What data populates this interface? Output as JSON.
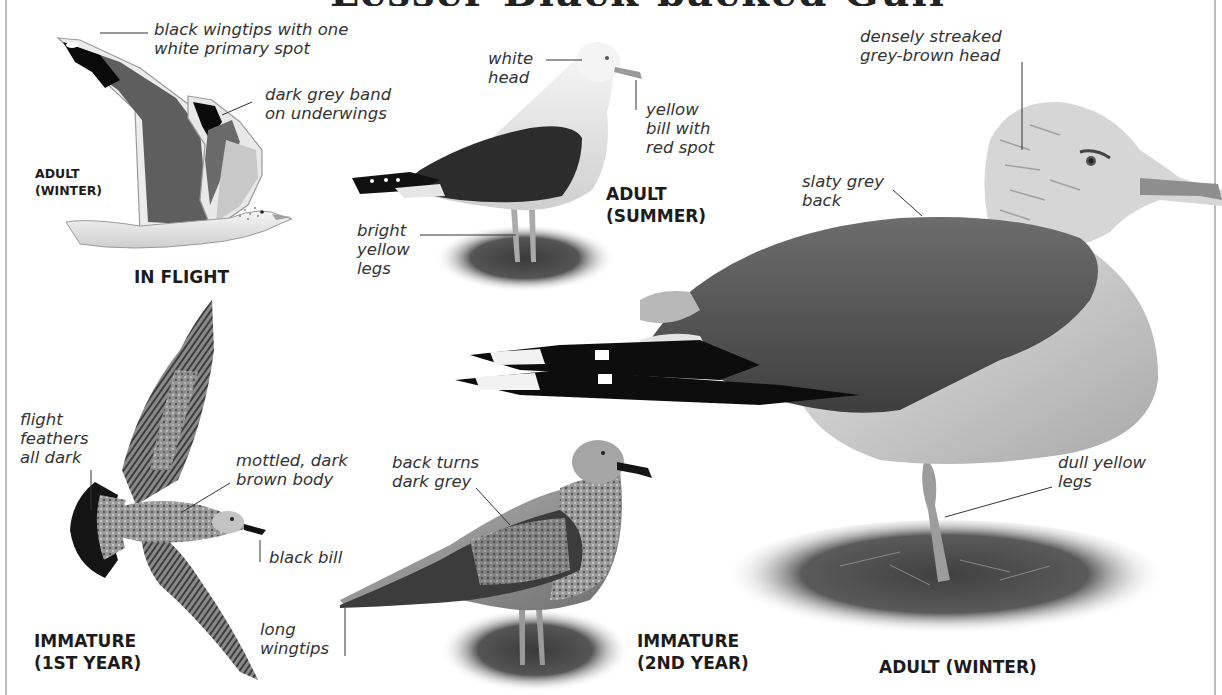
{
  "page": {
    "title_partial": "Lesser Black-backed Gull",
    "accent_colors": {
      "ink": "#1c1c1c",
      "annotation": "#333333",
      "border": "#bdbdbd"
    }
  },
  "figures": {
    "in_flight": {
      "caption": "IN FLIGHT",
      "sub_caption": "ADULT\n(WINTER)",
      "annotations": [
        {
          "text": "black wingtips with one\nwhite primary spot"
        },
        {
          "text": "dark grey band\non underwings"
        }
      ]
    },
    "adult_summer": {
      "caption": "ADULT\n(SUMMER)",
      "annotations": [
        {
          "text": "white\nhead"
        },
        {
          "text": "yellow\nbill with\nred spot"
        },
        {
          "text": "bright\nyellow\nlegs"
        }
      ]
    },
    "adult_winter": {
      "caption": "ADULT (WINTER)",
      "annotations": [
        {
          "text": "densely streaked\ngrey-brown head"
        },
        {
          "text": "slaty grey\nback"
        },
        {
          "text": "dull yellow\nlegs"
        }
      ]
    },
    "immature_1st_year": {
      "caption": "IMMATURE\n(1ST YEAR)",
      "annotations": [
        {
          "text": "flight\nfeathers\nall dark"
        },
        {
          "text": "mottled, dark\nbrown body"
        },
        {
          "text": "black bill"
        }
      ]
    },
    "immature_2nd_year": {
      "caption": "IMMATURE\n(2ND YEAR)",
      "annotations": [
        {
          "text": "back turns\ndark grey"
        },
        {
          "text": "long\nwingtips"
        }
      ]
    }
  }
}
